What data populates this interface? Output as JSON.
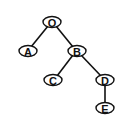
{
  "diagram": {
    "type": "binary-tree",
    "nodes": [
      {
        "id": "O",
        "label": "O",
        "x": 52,
        "y": 22
      },
      {
        "id": "A",
        "label": "A",
        "x": 28,
        "y": 51
      },
      {
        "id": "B",
        "label": "B",
        "x": 77,
        "y": 51
      },
      {
        "id": "C",
        "label": "C",
        "x": 53,
        "y": 80
      },
      {
        "id": "D",
        "label": "D",
        "x": 105,
        "y": 80
      },
      {
        "id": "E",
        "label": "E",
        "x": 105,
        "y": 108
      }
    ],
    "edges": [
      {
        "from": "O",
        "to": "A"
      },
      {
        "from": "O",
        "to": "B"
      },
      {
        "from": "B",
        "to": "C"
      },
      {
        "from": "B",
        "to": "D"
      },
      {
        "from": "D",
        "to": "E"
      }
    ]
  }
}
